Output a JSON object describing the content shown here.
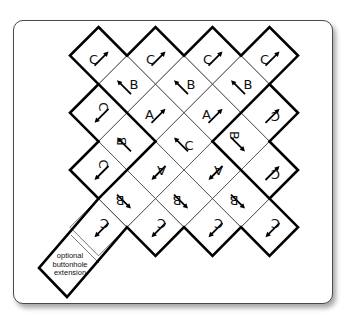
{
  "diagram": {
    "card": {
      "border_color": "#4a4a4a",
      "background": "#ffffff"
    },
    "lattice": {
      "x0": 70,
      "y0": 27,
      "dx": 28.5,
      "dy": 28.6
    },
    "cells": [
      {
        "i": 1,
        "j": 1,
        "letter": "C",
        "rot": 0,
        "lx": -5,
        "ly": 4,
        "arrow": "ne"
      },
      {
        "i": 3,
        "j": 1,
        "letter": "C",
        "rot": 0,
        "lx": -5,
        "ly": 4,
        "arrow": "ne"
      },
      {
        "i": 5,
        "j": 1,
        "letter": "C",
        "rot": 0,
        "lx": -5,
        "ly": 4,
        "arrow": "ne"
      },
      {
        "i": 7,
        "j": 1,
        "letter": "C",
        "rot": 0,
        "lx": -5,
        "ly": 4,
        "arrow": "ne"
      },
      {
        "i": 2,
        "j": 2,
        "letter": "B",
        "rot": 0,
        "lx": 7,
        "ly": 0,
        "arrow": "nw"
      },
      {
        "i": 4,
        "j": 2,
        "letter": "B",
        "rot": 0,
        "lx": 7,
        "ly": 0,
        "arrow": "nw"
      },
      {
        "i": 6,
        "j": 2,
        "letter": "B",
        "rot": 0,
        "lx": 7,
        "ly": 0,
        "arrow": "nw"
      },
      {
        "i": 1,
        "j": 3,
        "letter": "C",
        "rot": 90,
        "lx": 5,
        "ly": -6,
        "arrow": "sw"
      },
      {
        "i": 3,
        "j": 3,
        "letter": "A",
        "rot": 0,
        "lx": -6,
        "ly": 2,
        "arrow": "ne"
      },
      {
        "i": 5,
        "j": 3,
        "letter": "A",
        "rot": 0,
        "lx": -6,
        "ly": 2,
        "arrow": "ne"
      },
      {
        "i": 7,
        "j": 3,
        "letter": "C",
        "rot": 180,
        "lx": 6,
        "ly": 4,
        "arrow": "ne"
      },
      {
        "i": 2,
        "j": 4,
        "letter": "B",
        "rot": -90,
        "lx": -6,
        "ly": 0,
        "arrow": "nw"
      },
      {
        "i": 4,
        "j": 4,
        "letter": "C",
        "rot": 0,
        "lx": 5,
        "ly": 4,
        "arrow": "nw"
      },
      {
        "i": 6,
        "j": 4,
        "letter": "B",
        "rot": 90,
        "lx": -7,
        "ly": -6,
        "arrow": "se"
      },
      {
        "i": 1,
        "j": 5,
        "letter": "C",
        "rot": 90,
        "lx": 5,
        "ly": -6,
        "arrow": "sw"
      },
      {
        "i": 3,
        "j": 5,
        "letter": "A",
        "rot": 180,
        "lx": 6,
        "ly": 0,
        "arrow": "sw"
      },
      {
        "i": 5,
        "j": 5,
        "letter": "A",
        "rot": 180,
        "lx": 6,
        "ly": 0,
        "arrow": "sw"
      },
      {
        "i": 7,
        "j": 5,
        "letter": "C",
        "rot": 180,
        "lx": 6,
        "ly": 4,
        "arrow": "ne"
      },
      {
        "i": 2,
        "j": 6,
        "letter": "B",
        "rot": 180,
        "lx": -7,
        "ly": 2,
        "arrow": "se"
      },
      {
        "i": 4,
        "j": 6,
        "letter": "B",
        "rot": 180,
        "lx": -7,
        "ly": 2,
        "arrow": "se"
      },
      {
        "i": 6,
        "j": 6,
        "letter": "B",
        "rot": 180,
        "lx": -7,
        "ly": 2,
        "arrow": "se"
      },
      {
        "i": 1,
        "j": 7,
        "letter": "C",
        "rot": 180,
        "lx": 6,
        "ly": -4,
        "arrow": "sw"
      },
      {
        "i": 3,
        "j": 7,
        "letter": "C",
        "rot": 180,
        "lx": 6,
        "ly": -4,
        "arrow": "sw"
      },
      {
        "i": 5,
        "j": 7,
        "letter": "C",
        "rot": 180,
        "lx": 6,
        "ly": -4,
        "arrow": "sw"
      },
      {
        "i": 7,
        "j": 7,
        "letter": "C",
        "rot": 180,
        "lx": 6,
        "ly": -4,
        "arrow": "sw"
      }
    ],
    "extension": {
      "lines": [
        "optional",
        "buttonhole",
        "extension"
      ]
    }
  }
}
